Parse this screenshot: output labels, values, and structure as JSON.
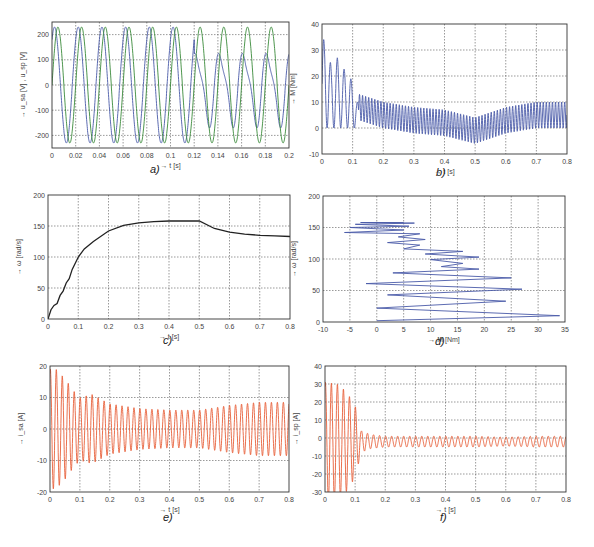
{
  "chart_data": [
    {
      "id": "a",
      "caption": "a)",
      "type": "line",
      "frame": {
        "x": 52,
        "y": 22,
        "w": 237,
        "h": 126
      },
      "xlabel": "→ t [s]",
      "ylabel": "→ u_sa [V] , u_sp [V]",
      "xlim": [
        0,
        0.2
      ],
      "ylim": [
        -250,
        250
      ],
      "xticks": [
        0,
        0.02,
        0.04,
        0.06,
        0.08,
        0.1,
        0.12,
        0.14,
        0.16,
        0.18,
        0.2
      ],
      "xtick_labels": [
        "0",
        "0.02",
        "0.04",
        "0.06",
        "0.08",
        "0.1",
        "0.12",
        "0.14",
        "0.16",
        "0.18",
        "0.2"
      ],
      "yticks": [
        -200,
        -100,
        0,
        100,
        200
      ],
      "ytick_labels": [
        "-200",
        "-100",
        "0",
        "100",
        "200"
      ],
      "grid": true,
      "series": [
        {
          "name": "u_sa",
          "color": "#4a5aa8",
          "description": "Sinusoid ~230 V amplitude, 50 Hz; after t≈0.12 s shows distorted/reduced peaks (~130 V positive, ~-150 V negative bump)",
          "amplitude": 230,
          "freq_hz": 50
        },
        {
          "name": "u_sp",
          "color": "#3a8a3a",
          "description": "Sinusoid ~230 V amplitude, 50 Hz, phase-shifted",
          "amplitude": 230,
          "freq_hz": 50
        }
      ]
    },
    {
      "id": "b",
      "caption": "b)",
      "type": "line",
      "frame": {
        "x": 322,
        "y": 24,
        "w": 245,
        "h": 130
      },
      "xlabel": "→ t [s]",
      "ylabel": "→ M [Nm]",
      "xlim": [
        0,
        0.8
      ],
      "ylim": [
        -10,
        40
      ],
      "xticks": [
        0,
        0.1,
        0.2,
        0.3,
        0.4,
        0.5,
        0.6,
        0.7,
        0.8
      ],
      "xtick_labels": [
        "0",
        "0.1",
        "0.2",
        "0.3",
        "0.4",
        "0.5",
        "0.6",
        "0.7",
        "0.8"
      ],
      "yticks": [
        -10,
        0,
        10,
        20,
        30,
        40
      ],
      "ytick_labels": [
        "-10",
        "0",
        "10",
        "20",
        "30",
        "40"
      ],
      "grid": true,
      "series": [
        {
          "name": "M",
          "color": "#4a5aa8",
          "description": "Torque: large oscillations up to 34 Nm in first 0.1 s decaying, then ripple ~±5 Nm around ~2 Nm dipping to ~-7 at 0.5 s, rising to ~5 Nm by 0.8 s",
          "envelope": [
            [
              0.01,
              34
            ],
            [
              0.03,
              24
            ],
            [
              0.05,
              27
            ],
            [
              0.07,
              23
            ],
            [
              0.1,
              18
            ],
            [
              0.12,
              8
            ],
            [
              0.2,
              5
            ],
            [
              0.3,
              3
            ],
            [
              0.4,
              2
            ],
            [
              0.5,
              -1
            ],
            [
              0.6,
              3
            ],
            [
              0.7,
              5
            ],
            [
              0.8,
              5
            ]
          ]
        }
      ]
    },
    {
      "id": "c",
      "caption": "c)",
      "type": "line",
      "frame": {
        "x": 48,
        "y": 195,
        "w": 242,
        "h": 124
      },
      "xlabel": "→ t [s]",
      "ylabel": "→ ω [rad/s]",
      "xlim": [
        0,
        0.8
      ],
      "ylim": [
        0,
        200
      ],
      "xticks": [
        0,
        0.1,
        0.2,
        0.3,
        0.4,
        0.5,
        0.6,
        0.7,
        0.8
      ],
      "xtick_labels": [
        "0",
        "0.1",
        "0.2",
        "0.3",
        "0.4",
        "0.5",
        "0.6",
        "0.7",
        "0.8"
      ],
      "yticks": [
        0,
        50,
        100,
        150,
        200
      ],
      "ytick_labels": [
        "0",
        "50",
        "100",
        "150",
        "200"
      ],
      "grid": true,
      "series": [
        {
          "name": "ω",
          "color": "#222222",
          "x": [
            0,
            0.01,
            0.02,
            0.03,
            0.04,
            0.05,
            0.06,
            0.07,
            0.08,
            0.1,
            0.12,
            0.15,
            0.2,
            0.25,
            0.3,
            0.35,
            0.4,
            0.45,
            0.5,
            0.55,
            0.6,
            0.65,
            0.7,
            0.75,
            0.8
          ],
          "y": [
            0,
            15,
            22,
            25,
            38,
            45,
            58,
            65,
            80,
            100,
            113,
            125,
            142,
            151,
            155,
            157,
            158,
            158,
            158,
            146,
            140,
            137,
            135,
            134,
            133
          ]
        }
      ]
    },
    {
      "id": "d",
      "caption": "d)",
      "type": "line",
      "frame": {
        "x": 323,
        "y": 196,
        "w": 242,
        "h": 126
      },
      "xlabel": "→ M [Nm]",
      "ylabel": "→ ω [rad/s]",
      "xlim": [
        -10,
        35
      ],
      "ylim": [
        0,
        200
      ],
      "xticks": [
        -10,
        -5,
        0,
        5,
        10,
        15,
        20,
        25,
        30,
        35
      ],
      "xtick_labels": [
        "-10",
        "-5",
        "0",
        "5",
        "10",
        "15",
        "20",
        "25",
        "30",
        "35"
      ],
      "yticks": [
        0,
        50,
        100,
        150,
        200
      ],
      "ytick_labels": [
        "0",
        "50",
        "100",
        "150",
        "200"
      ],
      "grid": true,
      "series": [
        {
          "name": "ω(M)",
          "color": "#4a5aa8",
          "description": "Dynamic torque-speed trajectory; zig-zag from (0..34, 0) up to dense cluster around M -6..8, ω 135..158",
          "x": [
            0,
            34,
            0,
            24,
            2,
            27,
            -2,
            25,
            3,
            19,
            12,
            16,
            10,
            19,
            9,
            16,
            5,
            8,
            2,
            9,
            4,
            8,
            -6,
            5,
            -5,
            6,
            -4,
            7,
            -3,
            5
          ],
          "y": [
            2,
            10,
            22,
            33,
            43,
            52,
            61,
            70,
            78,
            84,
            88,
            93,
            99,
            103,
            108,
            112,
            116,
            122,
            126,
            131,
            135,
            140,
            142,
            146,
            150,
            152,
            155,
            157,
            158,
            158
          ]
        }
      ]
    },
    {
      "id": "e",
      "caption": "e)",
      "type": "line",
      "frame": {
        "x": 50,
        "y": 366,
        "w": 239,
        "h": 126
      },
      "xlabel": "→ t [s]",
      "ylabel": "→ i_sa [A]",
      "xlim": [
        0,
        0.8
      ],
      "ylim": [
        -20,
        20
      ],
      "xticks": [
        0,
        0.1,
        0.2,
        0.3,
        0.4,
        0.5,
        0.6,
        0.7,
        0.8
      ],
      "xtick_labels": [
        "0",
        "0.1",
        "0.2",
        "0.3",
        "0.4",
        "0.5",
        "0.6",
        "0.7",
        "0.8"
      ],
      "yticks": [
        -20,
        -10,
        0,
        10,
        20
      ],
      "ytick_labels": [
        "-20",
        "-10",
        "0",
        "10",
        "20"
      ],
      "grid": true,
      "series": [
        {
          "name": "i_sa",
          "color": "#e8603a",
          "freq_hz": 50,
          "envelope": [
            [
              0,
              19
            ],
            [
              0.02,
              19
            ],
            [
              0.05,
              16
            ],
            [
              0.08,
              12
            ],
            [
              0.1,
              10
            ],
            [
              0.14,
              11
            ],
            [
              0.2,
              8
            ],
            [
              0.3,
              6.5
            ],
            [
              0.4,
              6
            ],
            [
              0.5,
              6
            ],
            [
              0.6,
              7.5
            ],
            [
              0.7,
              8.5
            ],
            [
              0.8,
              8.5
            ]
          ]
        }
      ]
    },
    {
      "id": "f",
      "caption": "f)",
      "type": "line",
      "frame": {
        "x": 325,
        "y": 366,
        "w": 241,
        "h": 126
      },
      "xlabel": "→ t [s]",
      "ylabel": "→ i_sp [A]",
      "xlim": [
        0,
        0.8
      ],
      "ylim": [
        -30,
        40
      ],
      "xticks": [
        0,
        0.1,
        0.2,
        0.3,
        0.4,
        0.5,
        0.6,
        0.7,
        0.8
      ],
      "xtick_labels": [
        "0",
        "0.1",
        "0.2",
        "0.3",
        "0.4",
        "0.5",
        "0.6",
        "0.7",
        "0.8"
      ],
      "yticks": [
        -30,
        -20,
        -10,
        0,
        10,
        20,
        30,
        40
      ],
      "ytick_labels": [
        "-30",
        "-20",
        "-10",
        "0",
        "10",
        "20",
        "30",
        "40"
      ],
      "grid": true,
      "series": [
        {
          "name": "i_sp",
          "color": "#e8603a",
          "freq_hz": 50,
          "offset": -2,
          "envelope": [
            [
              0,
              33
            ],
            [
              0.04,
              32
            ],
            [
              0.07,
              28
            ],
            [
              0.1,
              20
            ],
            [
              0.12,
              6
            ],
            [
              0.15,
              4
            ],
            [
              0.2,
              3
            ],
            [
              0.3,
              3
            ],
            [
              0.4,
              3
            ],
            [
              0.5,
              3
            ],
            [
              0.6,
              2.5
            ],
            [
              0.7,
              3
            ],
            [
              0.8,
              3
            ]
          ]
        }
      ]
    }
  ]
}
